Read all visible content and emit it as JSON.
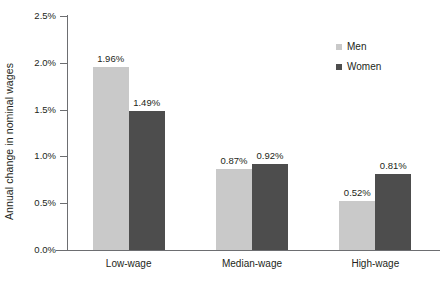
{
  "chart_data": {
    "type": "bar",
    "title": "",
    "xlabel": "",
    "ylabel": "Annual change in nominal wages",
    "categories": [
      "Low-wage",
      "Median-wage",
      "High-wage"
    ],
    "series": [
      {
        "name": "Men",
        "color": "#c9c9c9",
        "values": [
          1.96,
          0.87,
          0.52
        ],
        "labels": [
          "1.96%",
          "0.87%",
          "0.52%"
        ]
      },
      {
        "name": "Women",
        "color": "#4d4d4d",
        "values": [
          1.49,
          0.92,
          0.81
        ],
        "labels": [
          "1.49%",
          "0.92%",
          "0.81%"
        ]
      }
    ],
    "ylim": [
      0,
      2.5
    ],
    "ytick_values": [
      0.0,
      0.5,
      1.0,
      1.5,
      2.0,
      2.5
    ],
    "ytick_labels": [
      "0.0%",
      "0.5%",
      "1.0%",
      "1.5%",
      "2.0%",
      "2.5%"
    ],
    "grid": false,
    "legend_position": "top-right",
    "legend": [
      {
        "label": "Men",
        "color": "#c9c9c9"
      },
      {
        "label": "Women",
        "color": "#4d4d4d"
      }
    ]
  }
}
